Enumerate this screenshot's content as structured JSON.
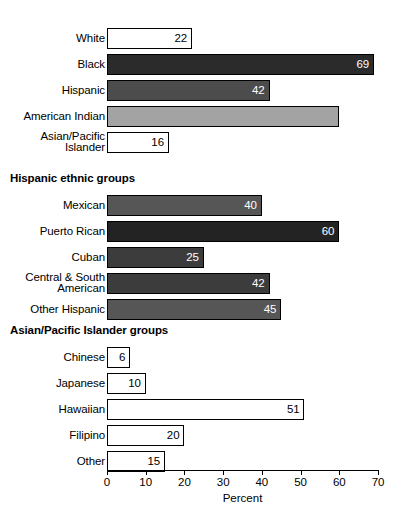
{
  "chart_data": {
    "type": "bar",
    "orientation": "horizontal",
    "title": "",
    "xlabel": "Percent",
    "ylabel": "",
    "xlim": [
      0,
      70
    ],
    "xticks": [
      0,
      10,
      20,
      30,
      40,
      50,
      60,
      70
    ],
    "xtick_labels": [
      "0",
      "10",
      "20",
      "30",
      "40",
      "50",
      "60",
      "70"
    ],
    "grid": false,
    "legend": "none",
    "panels": [
      {
        "heading": "",
        "categories": [
          "White",
          "Black",
          "Hispanic",
          "American Indian",
          "Asian/Pacific\nIslander"
        ],
        "values": [
          22,
          69,
          42,
          60,
          16
        ],
        "labels": [
          "22",
          "69",
          "42",
          "",
          "16"
        ],
        "fills": [
          "#ffffff",
          "#2b2b2b",
          "#4c4c4c",
          "#a3a3a3",
          "#ffffff"
        ],
        "label_colors": [
          "#000000",
          "#ffffff",
          "#ffffff",
          "#000000",
          "#000000"
        ]
      },
      {
        "heading": "Hispanic ethnic groups",
        "categories": [
          "Mexican",
          "Puerto Rican",
          "Cuban",
          "Central & South\nAmerican",
          "Other Hispanic"
        ],
        "values": [
          40,
          60,
          25,
          42,
          45
        ],
        "labels": [
          "40",
          "60",
          "25",
          "42",
          "45"
        ],
        "fills": [
          "#565656",
          "#232323",
          "#3c3c3c",
          "#3c3c3c",
          "#565656"
        ],
        "label_colors": [
          "#ffffff",
          "#ffffff",
          "#ffffff",
          "#ffffff",
          "#ffffff"
        ]
      },
      {
        "heading": "Asian/Pacific Islander groups",
        "categories": [
          "Chinese",
          "Japanese",
          "Hawaiian",
          "Filipino",
          "Other"
        ],
        "values": [
          6,
          10,
          51,
          20,
          15
        ],
        "labels": [
          "6",
          "10",
          "51",
          "20",
          "15"
        ],
        "fills": [
          "#ffffff",
          "#ffffff",
          "#ffffff",
          "#ffffff",
          "#ffffff"
        ],
        "label_colors": [
          "#000000",
          "#000000",
          "#000000",
          "#000000",
          "#000000"
        ]
      }
    ]
  },
  "geometry": {
    "axis_left_px": 107,
    "px_per_unit": 3.872,
    "bar_height_px": 21,
    "row_gap_px": 5,
    "panel_tops": [
      28,
      195,
      347
    ],
    "heading_tops": [
      0,
      172,
      324
    ],
    "axis_top_px": 470
  }
}
